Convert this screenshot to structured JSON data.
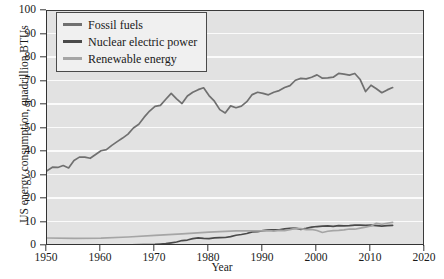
{
  "chart_data": {
    "type": "line",
    "title": "",
    "xlabel": "Year",
    "ylabel": "US energy consumption, quadrillion BTUs",
    "xlim": [
      1950,
      2020
    ],
    "ylim": [
      0,
      100
    ],
    "xticks": [
      1950,
      1960,
      1970,
      1980,
      1990,
      2000,
      2010,
      2020
    ],
    "yticks": [
      0,
      10,
      20,
      30,
      40,
      50,
      60,
      70,
      80,
      90,
      100
    ],
    "grid": "horizontal",
    "legend_position": "upper-left",
    "background": "#e2e2e2",
    "series": [
      {
        "name": "Fossil fuels",
        "color": "#707070",
        "x": [
          1950,
          1951,
          1952,
          1953,
          1954,
          1955,
          1956,
          1957,
          1958,
          1959,
          1960,
          1961,
          1962,
          1963,
          1964,
          1965,
          1966,
          1967,
          1968,
          1969,
          1970,
          1971,
          1972,
          1973,
          1974,
          1975,
          1976,
          1977,
          1978,
          1979,
          1980,
          1981,
          1982,
          1983,
          1984,
          1985,
          1986,
          1987,
          1988,
          1989,
          1990,
          1991,
          1992,
          1993,
          1994,
          1995,
          1996,
          1997,
          1998,
          1999,
          2000,
          2001,
          2002,
          2003,
          2004,
          2005,
          2006,
          2007,
          2008,
          2009,
          2010,
          2011,
          2012,
          2013,
          2014
        ],
        "values": [
          31.6,
          33.1,
          33.0,
          33.8,
          32.8,
          36.0,
          37.4,
          37.4,
          36.9,
          38.5,
          40.1,
          40.6,
          42.4,
          44.0,
          45.5,
          47.2,
          49.8,
          51.4,
          54.4,
          57.0,
          59.0,
          59.4,
          62.0,
          64.5,
          62.2,
          60.2,
          63.4,
          65.0,
          66.1,
          66.9,
          63.6,
          61.2,
          57.6,
          56.2,
          59.2,
          58.4,
          59.1,
          61.0,
          64.0,
          65.0,
          64.5,
          63.9,
          65.0,
          65.7,
          67.0,
          67.8,
          70.1,
          70.9,
          70.7,
          71.4,
          72.4,
          71.0,
          71.1,
          71.4,
          73.0,
          72.7,
          72.3,
          73.0,
          70.4,
          65.3,
          68.0,
          66.5,
          64.8,
          66.0,
          67.0
        ]
      },
      {
        "name": "Nuclear electric power",
        "color": "#4a4a4a",
        "x": [
          1950,
          1955,
          1960,
          1965,
          1970,
          1971,
          1972,
          1973,
          1974,
          1975,
          1976,
          1977,
          1978,
          1979,
          1980,
          1981,
          1982,
          1983,
          1984,
          1985,
          1986,
          1987,
          1988,
          1989,
          1990,
          1991,
          1992,
          1993,
          1994,
          1995,
          1996,
          1997,
          1998,
          1999,
          2000,
          2001,
          2002,
          2003,
          2004,
          2005,
          2006,
          2007,
          2008,
          2009,
          2010,
          2011,
          2012,
          2013,
          2014
        ],
        "values": [
          0.0,
          0.0,
          0.01,
          0.04,
          0.24,
          0.41,
          0.58,
          0.91,
          1.27,
          1.9,
          2.11,
          2.7,
          3.02,
          2.78,
          2.74,
          3.01,
          3.13,
          3.2,
          3.55,
          4.15,
          4.47,
          4.91,
          5.59,
          5.68,
          6.1,
          6.42,
          6.48,
          6.41,
          6.84,
          7.08,
          7.17,
          6.68,
          7.07,
          7.61,
          7.86,
          8.03,
          8.14,
          7.96,
          8.22,
          8.16,
          8.21,
          8.46,
          8.43,
          8.35,
          8.43,
          8.26,
          8.06,
          8.24,
          8.34
        ]
      },
      {
        "name": "Renewable energy",
        "color": "#a5a5a5",
        "x": [
          1950,
          1955,
          1960,
          1965,
          1970,
          1975,
          1980,
          1985,
          1990,
          1991,
          1992,
          1993,
          1994,
          1995,
          1996,
          1997,
          1998,
          1999,
          2000,
          2001,
          2002,
          2003,
          2004,
          2005,
          2006,
          2007,
          2008,
          2009,
          2010,
          2011,
          2012,
          2013,
          2014
        ],
        "values": [
          2.98,
          2.78,
          2.93,
          3.4,
          4.08,
          4.72,
          5.49,
          6.03,
          6.04,
          6.15,
          5.92,
          6.26,
          6.14,
          6.56,
          7.09,
          6.96,
          6.55,
          6.66,
          6.16,
          5.33,
          5.84,
          6.15,
          6.26,
          6.44,
          6.8,
          6.72,
          7.19,
          7.58,
          8.09,
          9.24,
          8.84,
          9.25,
          9.6
        ]
      }
    ]
  },
  "axes": {
    "ylabel": "US energy consumption, quadrillion BTUs",
    "xlabel": "Year",
    "ytick_labels": [
      "0",
      "10",
      "20",
      "30",
      "40",
      "50",
      "60",
      "70",
      "80",
      "90",
      "100"
    ],
    "xtick_labels": [
      "1950",
      "1960",
      "1970",
      "1980",
      "1990",
      "2000",
      "2010",
      "2020"
    ]
  },
  "legend": {
    "items": [
      {
        "label": "Fossil fuels",
        "color": "#707070"
      },
      {
        "label": "Nuclear electric power",
        "color": "#4a4a4a"
      },
      {
        "label": "Renewable energy",
        "color": "#a5a5a5"
      }
    ]
  }
}
